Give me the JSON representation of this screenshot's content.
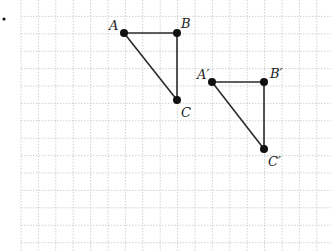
{
  "diagram": {
    "type": "coordinate-grid-translation",
    "grid": {
      "origin_x": 21,
      "origin_y": -1,
      "spacing": 17.4,
      "cols": 18,
      "rows": 15,
      "line_color": "#bdbdbd"
    },
    "marker_dot": {
      "x": 4,
      "y": 19
    },
    "line_color": "#2a2a2a",
    "point_color": "#111111",
    "triangles": [
      {
        "name": "ABC",
        "points": [
          {
            "label": "A",
            "x": 124,
            "y": 33,
            "lx": 109,
            "ly": 30
          },
          {
            "label": "B",
            "x": 177,
            "y": 33,
            "lx": 181,
            "ly": 28
          },
          {
            "label": "C",
            "x": 177,
            "y": 100,
            "lx": 181,
            "ly": 117
          }
        ]
      },
      {
        "name": "A'B'C'",
        "points": [
          {
            "label": "A′",
            "x": 212,
            "y": 82,
            "lx": 197,
            "ly": 79
          },
          {
            "label": "B′",
            "x": 264,
            "y": 82,
            "lx": 270,
            "ly": 78
          },
          {
            "label": "C′",
            "x": 264,
            "y": 149,
            "lx": 268,
            "ly": 166
          }
        ]
      }
    ]
  }
}
